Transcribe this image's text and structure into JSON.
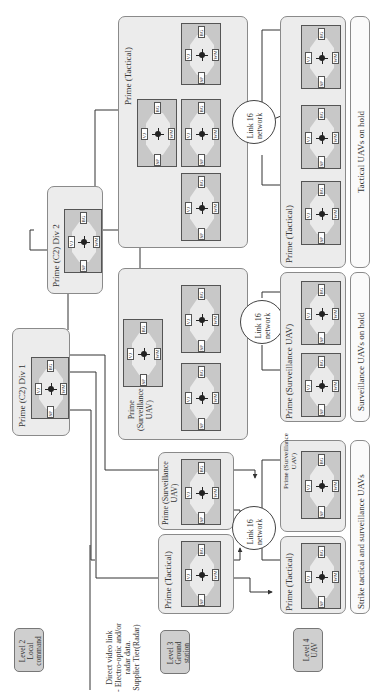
{
  "diagram": {
    "orientation": "rotated-90-ccw",
    "levels": [
      {
        "id": "level2",
        "label": "Level 2 Local command centre"
      },
      {
        "id": "level3",
        "label": "Level 3 Ground station"
      },
      {
        "id": "level4",
        "label": "Level 4 UAV"
      }
    ],
    "level_lines": {
      "level2": [
        "Level 2",
        "Local",
        "command",
        "centre"
      ],
      "level3": [
        "Level 3",
        "Ground",
        "station"
      ],
      "level4": [
        "Level 4",
        "UAV"
      ]
    },
    "annotation": {
      "lines": [
        "Direct video link",
        "- Electro-optic and/or",
        "radar data.",
        "Supplier Tier(Radar)"
      ]
    },
    "groups": {
      "c2_div1": "Prime (C2) Div 1",
      "c2_div2": "Prime (C2) Div 2",
      "tactical_top": "Prime (Tactical)",
      "surveillance_mid": [
        "Prime",
        "(Surveillance",
        "UAV)"
      ],
      "l3_tactical": "Prime (Tactical)",
      "l3_surveillance": [
        "Prime (Surveillance",
        "UAV)"
      ],
      "l4_tactical_strike": "Prime (Tactical)",
      "l4_surveillance_strike": [
        "Prime (Surveillance",
        "UAV)"
      ],
      "l4_surveillance_hold": "Prime (Surveillance UAV)",
      "l4_tactical_hold": "Prime (Tactical)"
    },
    "hold_labels": {
      "strike": "Strike tactical and surveillance UAVs",
      "surveillance": "Surveillance UAVs on hold",
      "tactical": "Tactical UAVs on hold"
    },
    "networks": [
      {
        "id": "net_strike",
        "lines": [
          "Link 16",
          "network"
        ]
      },
      {
        "id": "net_surv",
        "lines": [
          "Link 16",
          "network"
        ]
      },
      {
        "id": "net_tac",
        "lines": [
          "Link 16",
          "network"
        ]
      }
    ],
    "node_components": {
      "top": "BG",
      "left": "VJ",
      "right": "WM",
      "bottom": "SP",
      "center": "KP"
    },
    "colors": {
      "group_fill": "#ececec",
      "node_fill": "#c8c8c8",
      "level_fill": "#cfcfcf",
      "line": "#333333"
    }
  }
}
